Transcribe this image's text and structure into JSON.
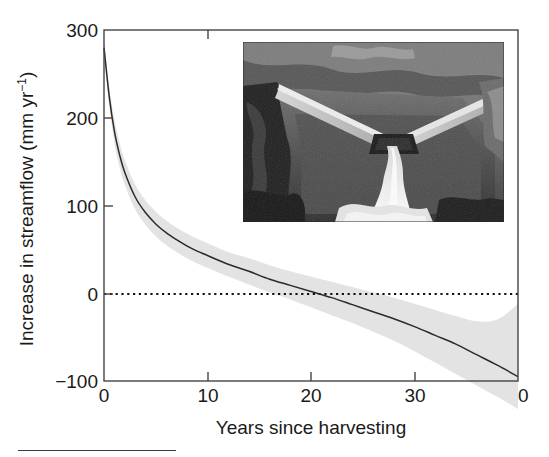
{
  "figure": {
    "background_color": "#ffffff",
    "axis_color": "#3a3a3a",
    "line_color": "#2b2b2b",
    "band_color": "#e2e2e2",
    "zero_line_color": "#1a1a1a"
  },
  "axes": {
    "y_title_main": "Increase in streamflow (mm yr",
    "y_title_exp": "−1",
    "y_title_close": ")",
    "y_title_full": "Increase in streamflow (mm yr⁻¹)",
    "x_title": "Years since harvesting"
  },
  "inset": {
    "name": "weir-photograph",
    "description": "Grayscale photograph of a V-notch weir with water flowing over it into a rocky stream channel"
  },
  "chart_data": {
    "type": "line",
    "title": "",
    "xlabel": "Years since harvesting",
    "ylabel": "Increase in streamflow (mm yr⁻¹)",
    "xlim": [
      0,
      40
    ],
    "ylim": [
      -100,
      300
    ],
    "xticks": [
      0,
      10,
      20,
      30,
      40
    ],
    "yticks": [
      -100,
      0,
      100,
      200,
      300
    ],
    "xtick_labels": [
      "0",
      "10",
      "20",
      "30",
      "40"
    ],
    "ytick_labels": [
      "-100",
      "0",
      "100",
      "200",
      "300"
    ],
    "grid": false,
    "legend": null,
    "reference_lines": [
      {
        "name": "zero-line",
        "orientation": "horizontal",
        "y": 0,
        "style": "dotted"
      }
    ],
    "x": [
      0,
      0.5,
      1,
      1.5,
      2,
      3,
      4,
      5,
      6,
      7,
      8,
      9,
      10,
      12,
      14,
      16,
      18,
      20,
      22,
      24,
      26,
      28,
      30,
      32,
      34,
      36,
      38,
      40
    ],
    "series": [
      {
        "name": "Mean increase in streamflow",
        "values": [
          280,
          225,
          185,
          158,
          138,
          110,
          92,
          79,
          69,
          61,
          54,
          48,
          43,
          33,
          25,
          16,
          9,
          2,
          -5,
          -13,
          -21,
          -29,
          -38,
          -48,
          -58,
          -70,
          -82,
          -95
        ]
      }
    ],
    "band": {
      "name": "confidence-band",
      "lower": [
        272,
        214,
        172,
        144,
        124,
        96,
        78,
        65,
        55,
        47,
        40,
        34,
        29,
        19,
        10,
        1,
        -7,
        -16,
        -25,
        -34,
        -44,
        -54,
        -66,
        -79,
        -92,
        -105,
        -118,
        -132
      ],
      "upper": [
        288,
        236,
        198,
        172,
        152,
        124,
        106,
        93,
        83,
        75,
        68,
        62,
        57,
        47,
        40,
        32,
        25,
        19,
        13,
        7,
        1,
        -5,
        -12,
        -19,
        -26,
        -32,
        -30,
        -12
      ]
    }
  },
  "ticks": {
    "y": [
      {
        "label": "300",
        "value": 300
      },
      {
        "label": "200",
        "value": 200
      },
      {
        "label": "100",
        "value": 100
      },
      {
        "label": "0",
        "value": 0
      },
      {
        "label": "−100",
        "value": -100
      }
    ],
    "x": [
      {
        "label": "0",
        "value": 0
      },
      {
        "label": "10",
        "value": 10
      },
      {
        "label": "20",
        "value": 20
      },
      {
        "label": "30",
        "value": 30
      },
      {
        "label": "40",
        "value": 40
      }
    ]
  }
}
